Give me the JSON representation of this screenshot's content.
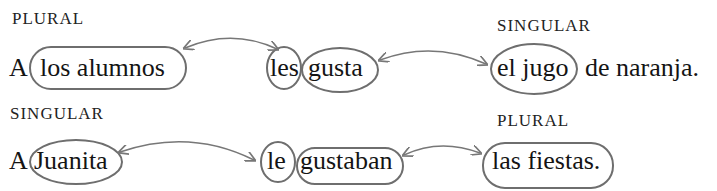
{
  "rows": [
    {
      "left_label": "PLURAL",
      "right_label": "SINGULAR",
      "preposition": "A",
      "subject": "los alumnos",
      "pronoun": "les",
      "verb": "gusta",
      "object": "el jugo",
      "rest": "de naranja."
    },
    {
      "left_label": "SINGULAR",
      "right_label": "PLURAL",
      "preposition": "A",
      "subject": "Juanita",
      "pronoun": "le",
      "verb": "gustaban",
      "object": "las fiestas.",
      "rest": ""
    }
  ],
  "colors": {
    "text": "#141414",
    "oval_stroke": "#6e6e6e",
    "arrow_stroke": "#777777",
    "background": "#ffffff"
  }
}
